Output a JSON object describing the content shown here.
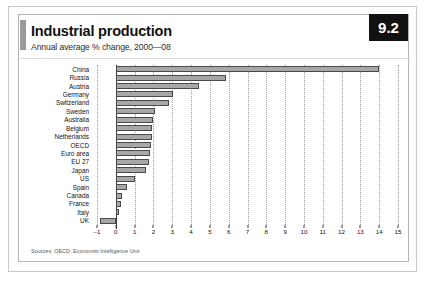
{
  "page": {
    "badge": "9.2",
    "title": "Industrial production",
    "subtitle": "Annual average % change, 2000—08",
    "source": "Sources: OECD; Economist Intelligence Unit"
  },
  "chart_data": {
    "type": "bar",
    "orientation": "horizontal",
    "title": "Industrial production",
    "subtitle": "Annual average % change, 2000—08",
    "xlabel": "",
    "ylabel": "",
    "xlim": [
      -1,
      15
    ],
    "xticks": [
      -1,
      0,
      1,
      2,
      3,
      4,
      5,
      6,
      7,
      8,
      9,
      10,
      11,
      12,
      13,
      14,
      15
    ],
    "xtick_labels": [
      "–1",
      "0",
      "1",
      "2",
      "3",
      "4",
      "5",
      "6",
      "7",
      "8",
      "9",
      "10",
      "11",
      "12",
      "13",
      "14",
      "15"
    ],
    "grid": true,
    "legend": null,
    "categories": [
      "China",
      "Russia",
      "Austria",
      "Germany",
      "Switzerland",
      "Sweden",
      "Australia",
      "Belgium",
      "Netherlands",
      "OECD",
      "Euro area",
      "EU 27",
      "Japan",
      "US",
      "Spain",
      "Canada",
      "France",
      "Italy",
      "UK"
    ],
    "values": [
      14.0,
      5.85,
      4.4,
      3.05,
      2.85,
      2.1,
      2.0,
      1.95,
      1.9,
      1.85,
      1.8,
      1.75,
      1.6,
      1.0,
      0.6,
      0.35,
      0.3,
      0.15,
      -0.85
    ],
    "colors": {
      "bar_fill": "#a7a7a7",
      "bar_stroke": "#4a4a4a",
      "axis": "#3a3a3a",
      "grid": "#9b9b9b",
      "badge_bg": "#111111",
      "badge_fg": "#ffffff"
    }
  }
}
